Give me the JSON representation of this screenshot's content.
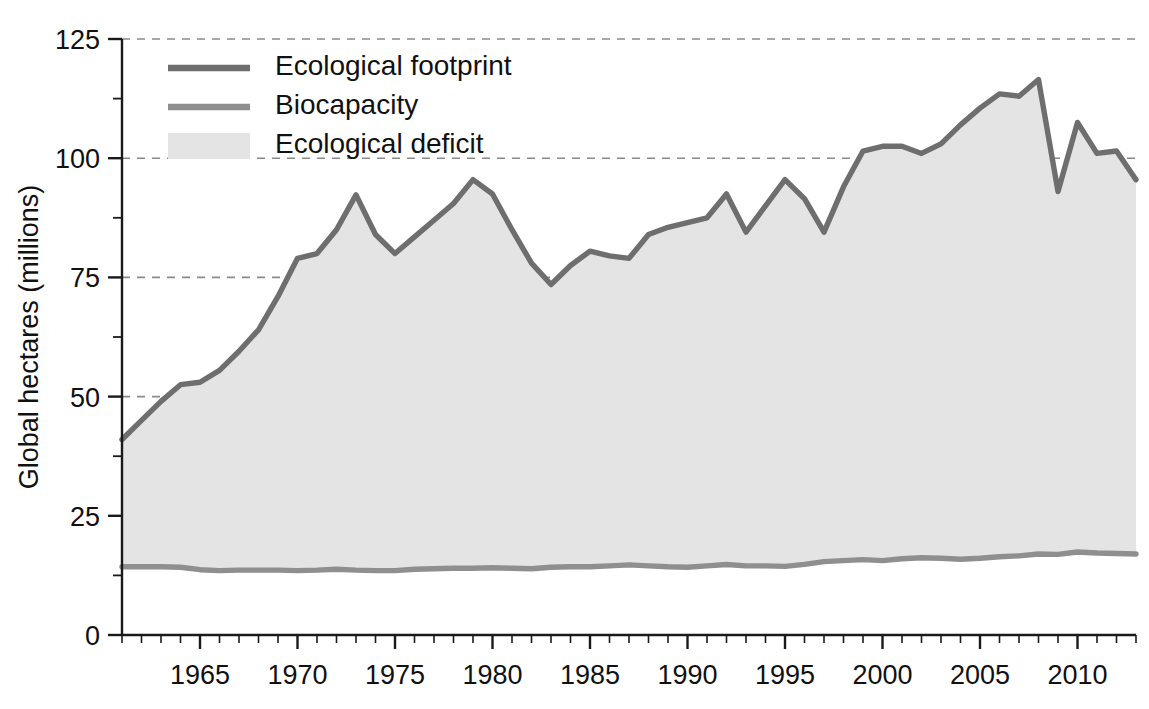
{
  "chart_data": {
    "type": "area",
    "title": "",
    "xlabel": "",
    "ylabel": "Global hectares (millions)",
    "xlim": [
      1961,
      2013
    ],
    "ylim": [
      0,
      125
    ],
    "yticks": [
      0,
      25,
      50,
      75,
      100,
      125
    ],
    "ytick_labels": [
      "0",
      "25",
      "50",
      "75",
      "100",
      "125"
    ],
    "y_minor_step": 12.5,
    "xticks": [
      1965,
      1970,
      1975,
      1980,
      1985,
      1990,
      1995,
      2000,
      2005,
      2010
    ],
    "xtick_labels": [
      "1965",
      "1970",
      "1975",
      "1980",
      "1985",
      "1990",
      "1995",
      "2000",
      "2005",
      "2010"
    ],
    "x_minor_step": 1,
    "grid": "horizontal-dashed",
    "legend_position": "top-left",
    "x": [
      1961,
      1962,
      1963,
      1964,
      1965,
      1966,
      1967,
      1968,
      1969,
      1970,
      1971,
      1972,
      1973,
      1974,
      1975,
      1976,
      1977,
      1978,
      1979,
      1980,
      1981,
      1982,
      1983,
      1984,
      1985,
      1986,
      1987,
      1988,
      1989,
      1990,
      1991,
      1992,
      1993,
      1994,
      1995,
      1996,
      1997,
      1998,
      1999,
      2000,
      2001,
      2002,
      2003,
      2004,
      2005,
      2006,
      2007,
      2008,
      2009,
      2010,
      2011,
      2012,
      2013
    ],
    "series": [
      {
        "name": "Ecological footprint",
        "color": "#6e6e6e",
        "values": [
          41.0,
          45.0,
          49.0,
          52.5,
          53.0,
          55.5,
          59.5,
          64.0,
          71.0,
          79.0,
          80.0,
          85.0,
          92.3,
          84.0,
          80.0,
          83.5,
          87.0,
          90.5,
          95.5,
          92.5,
          85.0,
          78.0,
          73.5,
          77.5,
          80.5,
          79.5,
          79.0,
          84.0,
          85.5,
          86.5,
          87.5,
          92.5,
          84.5,
          90.0,
          95.5,
          91.5,
          84.5,
          94.0,
          101.5,
          102.5,
          102.5,
          101.0,
          103.0,
          107.0,
          110.5,
          113.5,
          113.0,
          116.5,
          93.0,
          107.5,
          101.0,
          101.5,
          95.5
        ]
      },
      {
        "name": "Biocapacity",
        "color": "#8f8f8f",
        "values": [
          14.3,
          14.3,
          14.3,
          14.2,
          13.7,
          13.5,
          13.6,
          13.6,
          13.6,
          13.5,
          13.6,
          13.8,
          13.6,
          13.5,
          13.5,
          13.8,
          13.9,
          14.0,
          14.0,
          14.1,
          14.0,
          13.9,
          14.2,
          14.3,
          14.3,
          14.5,
          14.7,
          14.5,
          14.3,
          14.2,
          14.5,
          14.8,
          14.5,
          14.5,
          14.4,
          14.8,
          15.4,
          15.6,
          15.8,
          15.6,
          16.0,
          16.2,
          16.1,
          15.9,
          16.1,
          16.4,
          16.6,
          17.0,
          16.9,
          17.4,
          17.2,
          17.1,
          17.0
        ]
      }
    ],
    "band": {
      "name": "Ecological deficit",
      "color": "#e4e4e4",
      "between": [
        "Biocapacity",
        "Ecological footprint"
      ]
    },
    "legend": [
      {
        "label": "Ecological footprint",
        "marker": "line",
        "color": "#6e6e6e"
      },
      {
        "label": "Biocapacity",
        "marker": "line",
        "color": "#8f8f8f"
      },
      {
        "label": "Ecological deficit",
        "marker": "swatch",
        "color": "#e4e4e4"
      }
    ],
    "colors": {
      "axis": "#1a1a1a",
      "gridline": "#8a8a8a",
      "background": "#ffffff",
      "deficit_fill": "#e4e4e4",
      "footprint_line": "#6e6e6e",
      "biocapacity_line": "#8f8f8f"
    }
  }
}
